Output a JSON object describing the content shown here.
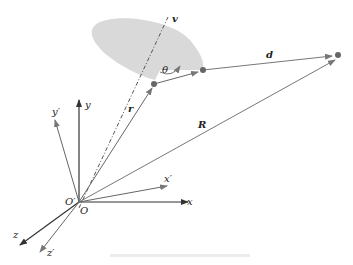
{
  "diagram": {
    "type": "vector geometry diagram",
    "labels": {
      "v": "v",
      "theta": "θ",
      "d": "d",
      "r": "r",
      "R": "R",
      "y": "y",
      "y_prime": "y′",
      "x": "x",
      "x_prime": "x′",
      "z": "z",
      "z_prime": "z′",
      "O": "O",
      "O_prime": "O′"
    },
    "colors": {
      "axes_primary": "#333333",
      "axes_secondary": "#666666",
      "vectors": "#666666",
      "shaded_region": "#d9d9d9",
      "points": "#555555"
    },
    "caption": ""
  }
}
